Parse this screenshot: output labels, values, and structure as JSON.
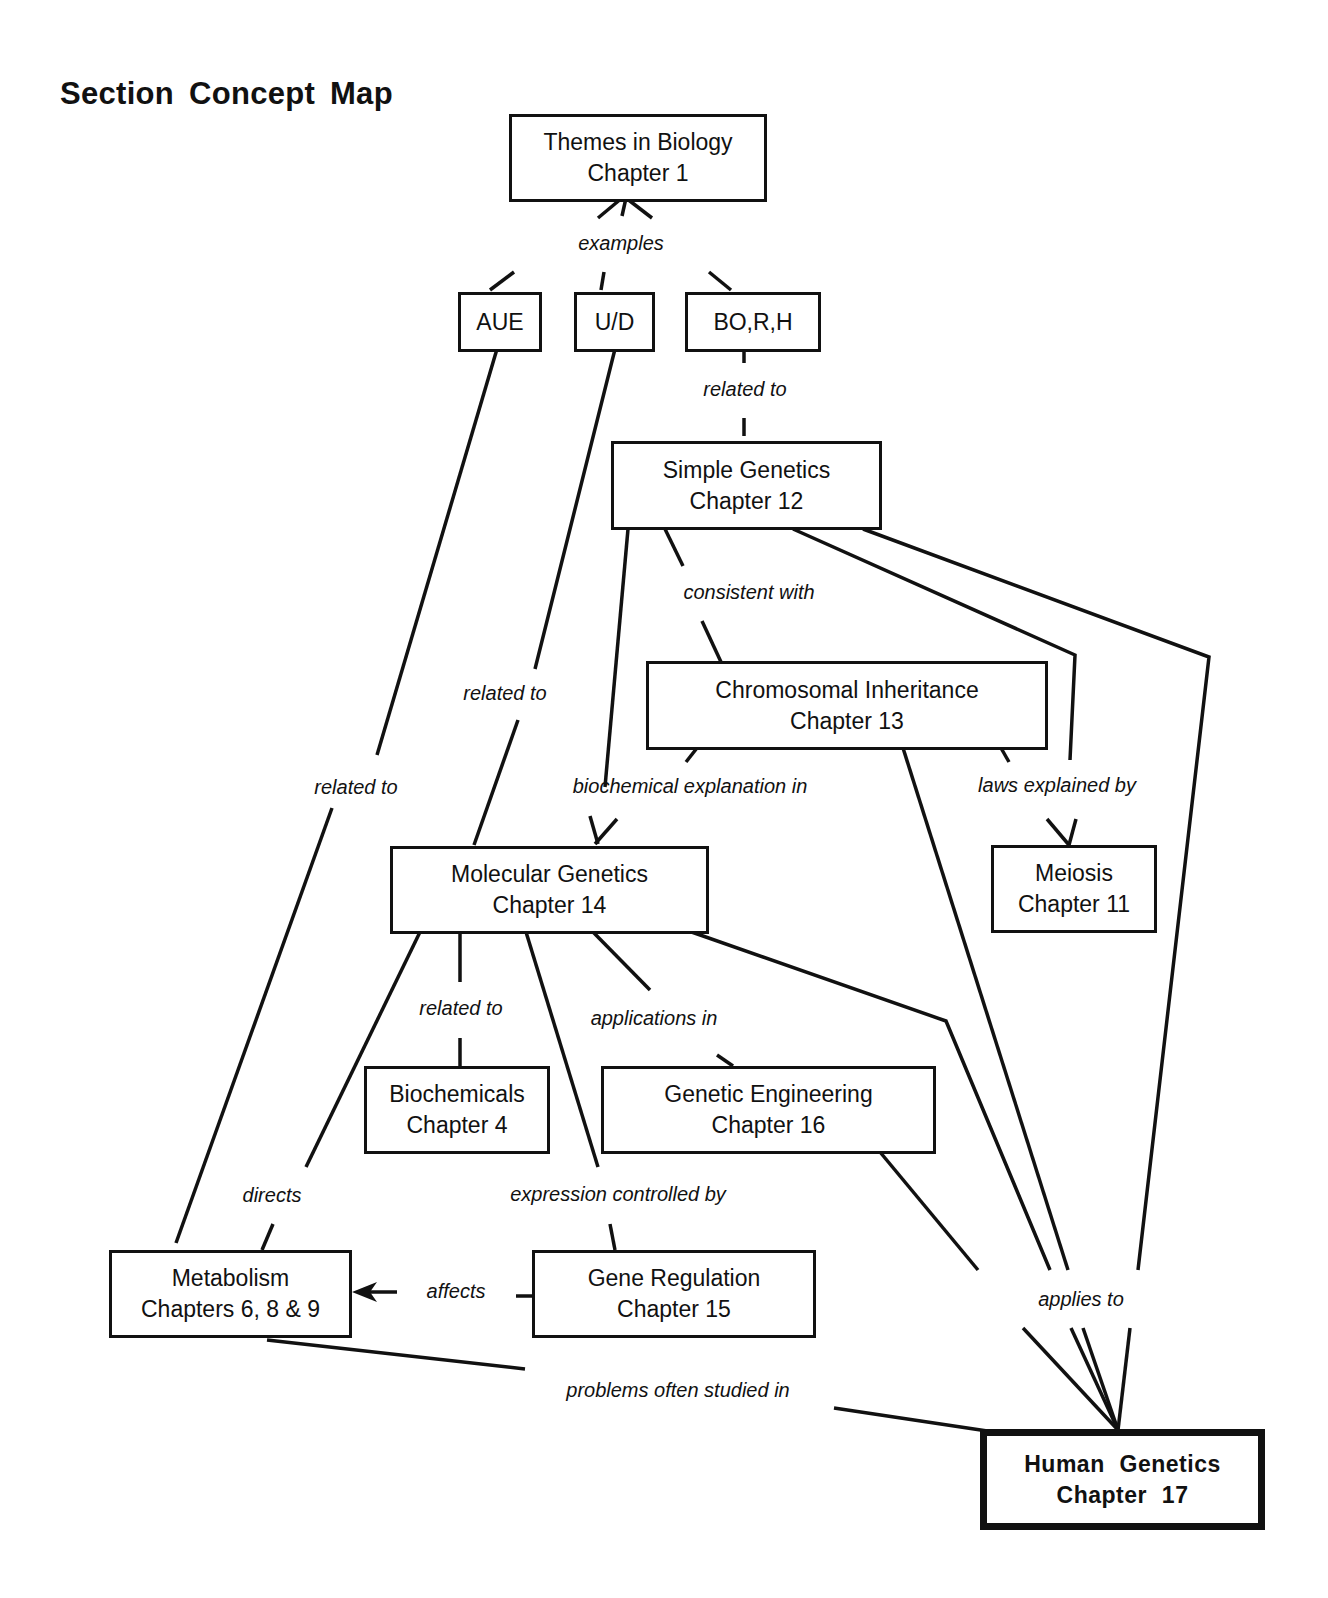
{
  "title": "Section Concept Map",
  "nodes": {
    "themes": {
      "line1": "Themes in Biology",
      "line2": "Chapter 1"
    },
    "aue": {
      "line1": "AUE"
    },
    "ud": {
      "line1": "U/D"
    },
    "borh": {
      "line1": "BO,R,H"
    },
    "simple": {
      "line1": "Simple Genetics",
      "line2": "Chapter 12"
    },
    "chromosomal": {
      "line1": "Chromosomal Inheritance",
      "line2": "Chapter 13"
    },
    "molecular": {
      "line1": "Molecular Genetics",
      "line2": "Chapter 14"
    },
    "meiosis": {
      "line1": "Meiosis",
      "line2": "Chapter 11"
    },
    "biochemicals": {
      "line1": "Biochemicals",
      "line2": "Chapter 4"
    },
    "engineering": {
      "line1": "Genetic Engineering",
      "line2": "Chapter 16"
    },
    "metabolism": {
      "line1": "Metabolism",
      "line2": "Chapters 6, 8 & 9"
    },
    "regulation": {
      "line1": "Gene Regulation",
      "line2": "Chapter 15"
    },
    "human": {
      "line1": "Human Genetics",
      "line2": "Chapter 17"
    }
  },
  "links": {
    "examples": "examples",
    "related_borh": "related to",
    "consistent": "consistent with",
    "related_ud": "related to",
    "related_aue": "related to",
    "biochemical": "biochemical explanation in",
    "laws": "laws explained by",
    "related_bio": "related to",
    "applications": "applications in",
    "directs": "directs",
    "expression": "expression controlled by",
    "affects": "affects",
    "applies": "applies to",
    "problems": "problems often studied in"
  },
  "colors": {
    "ink": "#111111",
    "background": "#ffffff"
  }
}
